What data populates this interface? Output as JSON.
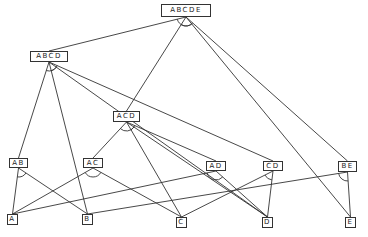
{
  "diagram": {
    "type": "and-or-graph",
    "nodes": [
      {
        "id": "ABCDE",
        "label": "ABCDE",
        "x": 161,
        "y": 4,
        "w": 50,
        "h": 13
      },
      {
        "id": "ABCD",
        "label": "ABCD",
        "x": 30,
        "y": 51,
        "w": 38,
        "h": 11
      },
      {
        "id": "ACD",
        "label": "ACD",
        "x": 113,
        "y": 111,
        "w": 27,
        "h": 11
      },
      {
        "id": "AB",
        "label": "AB",
        "x": 9,
        "y": 158,
        "w": 19,
        "h": 10
      },
      {
        "id": "AC",
        "label": "AC",
        "x": 83,
        "y": 158,
        "w": 20,
        "h": 10
      },
      {
        "id": "AD",
        "label": "AD",
        "x": 206,
        "y": 161,
        "w": 20,
        "h": 10
      },
      {
        "id": "CD",
        "label": "CD",
        "x": 263,
        "y": 161,
        "w": 20,
        "h": 10
      },
      {
        "id": "BE",
        "label": "BE",
        "x": 338,
        "y": 161,
        "w": 19,
        "h": 11
      },
      {
        "id": "A",
        "label": "A",
        "x": 7,
        "y": 214,
        "w": 11,
        "h": 11
      },
      {
        "id": "B",
        "label": "B",
        "x": 82,
        "y": 214,
        "w": 11,
        "h": 11
      },
      {
        "id": "C",
        "label": "C",
        "x": 176,
        "y": 217,
        "w": 11,
        "h": 11
      },
      {
        "id": "D",
        "label": "D",
        "x": 262,
        "y": 217,
        "w": 11,
        "h": 11
      },
      {
        "id": "E",
        "label": "E",
        "x": 345,
        "y": 217,
        "w": 11,
        "h": 11
      }
    ],
    "edges": [
      {
        "from": "ABCDE",
        "to": "ABCD"
      },
      {
        "from": "ABCDE",
        "to": "E"
      },
      {
        "from": "ABCDE",
        "to": "ACD"
      },
      {
        "from": "ABCDE",
        "to": "BE"
      },
      {
        "from": "ABCD",
        "to": "AB"
      },
      {
        "from": "ABCD",
        "to": "B"
      },
      {
        "from": "ABCD",
        "to": "CD"
      },
      {
        "from": "ABCD",
        "to": "D"
      },
      {
        "from": "ACD",
        "to": "AC"
      },
      {
        "from": "ACD",
        "to": "C"
      },
      {
        "from": "ACD",
        "to": "AD"
      },
      {
        "from": "ACD",
        "to": "D"
      },
      {
        "from": "AB",
        "to": "A"
      },
      {
        "from": "AB",
        "to": "B"
      },
      {
        "from": "AC",
        "to": "A"
      },
      {
        "from": "AC",
        "to": "C"
      },
      {
        "from": "AD",
        "to": "A"
      },
      {
        "from": "AD",
        "to": "D"
      },
      {
        "from": "CD",
        "to": "C"
      },
      {
        "from": "CD",
        "to": "D"
      },
      {
        "from": "BE",
        "to": "B"
      },
      {
        "from": "BE",
        "to": "E"
      }
    ],
    "and_arcs": [
      {
        "node": "ABCDE",
        "pair": [
          "ABCD",
          "E"
        ]
      },
      {
        "node": "ABCDE",
        "pair": [
          "ACD",
          "BE"
        ]
      },
      {
        "node": "ABCD",
        "pair": [
          "AB",
          "CD"
        ]
      },
      {
        "node": "ABCD",
        "pair": [
          "B",
          "D"
        ]
      },
      {
        "node": "ACD",
        "pair": [
          "AC",
          "D"
        ]
      },
      {
        "node": "ACD",
        "pair": [
          "C",
          "AD"
        ]
      },
      {
        "node": "AB",
        "pair": [
          "A",
          "B"
        ]
      },
      {
        "node": "AC",
        "pair": [
          "A",
          "C"
        ]
      },
      {
        "node": "AD",
        "pair": [
          "A",
          "D"
        ]
      },
      {
        "node": "CD",
        "pair": [
          "C",
          "D"
        ]
      },
      {
        "node": "BE",
        "pair": [
          "B",
          "E"
        ]
      }
    ],
    "line_color": "#333333"
  }
}
